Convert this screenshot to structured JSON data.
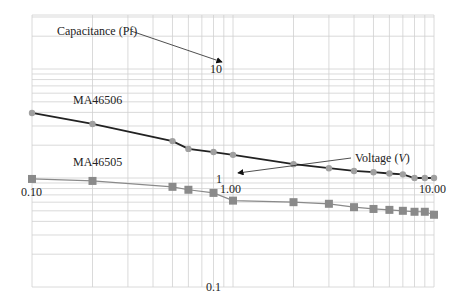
{
  "chart_data": {
    "type": "line",
    "title": "",
    "xlabel": "Voltage (V)",
    "ylabel": "Capacitance (Pf)",
    "xscale": "log",
    "yscale": "log",
    "xlim": [
      0.1,
      10
    ],
    "ylim": [
      0.1,
      30
    ],
    "grid": true,
    "x_tick_labels": [
      "0.10",
      "1.00",
      "10.00"
    ],
    "y_tick_labels": [
      "0.1",
      "1",
      "10"
    ],
    "annotations": [
      {
        "text": "Capacitance (Pf)",
        "arrow_to": "y-axis label 10"
      },
      {
        "text": "Voltage (V)",
        "arrow_to": "x-axis label 1"
      },
      {
        "text": "MA46506",
        "series": "MA46506"
      },
      {
        "text": "MA46505",
        "series": "MA46505"
      }
    ],
    "x": [
      0.1,
      0.2,
      0.5,
      0.6,
      0.8,
      1.0,
      2,
      3,
      4,
      5,
      6,
      7,
      8,
      9,
      10
    ],
    "series": [
      {
        "name": "MA46506",
        "marker": "diamond",
        "line_color": "#222222",
        "marker_color": "#a0a0a0",
        "values": [
          3.95,
          3.13,
          2.18,
          1.85,
          1.73,
          1.63,
          1.34,
          1.23,
          1.16,
          1.13,
          1.1,
          1.08,
          1.0,
          1.0,
          1.0
        ]
      },
      {
        "name": "MA46505",
        "marker": "square",
        "line_color": "#8a8a8a",
        "marker_color": "#8a8a8a",
        "values": [
          0.98,
          0.94,
          0.83,
          0.78,
          0.73,
          0.62,
          0.6,
          0.58,
          0.54,
          0.52,
          0.51,
          0.5,
          0.49,
          0.49,
          0.46
        ]
      }
    ]
  },
  "labels": {
    "capacitance": "Capacitance (Pf)",
    "voltage_prefix": "Voltage (",
    "voltage_unit": "V",
    "voltage_suffix": ")",
    "ma46506": "MA46506",
    "ma46505": "MA46505",
    "x_0_10": "0.10",
    "x_1_00": "1.00",
    "x_10_00": "10.00",
    "y_0_1": "0.1",
    "y_1": "1",
    "y_10": "10"
  }
}
